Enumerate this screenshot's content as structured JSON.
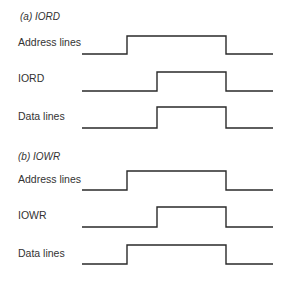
{
  "diagram": {
    "type": "timing-diagram",
    "colors": {
      "line": "#2a2a2a",
      "text": "#333333",
      "background": "#ffffff"
    },
    "sections": [
      {
        "title": "(a) IORD",
        "title_y": 20,
        "signals": [
          {
            "label": "Address lines",
            "label_y": 46,
            "high_y": 36,
            "low_y": 54,
            "x_start": 82,
            "x_rise": 127,
            "x_fall": 226,
            "x_end": 273
          },
          {
            "label": "IORD",
            "label_y": 82,
            "high_y": 72,
            "low_y": 91,
            "x_start": 82,
            "x_rise": 157,
            "x_fall": 226,
            "x_end": 273
          },
          {
            "label": "Data lines",
            "label_y": 120,
            "high_y": 107,
            "low_y": 128,
            "x_start": 82,
            "x_rise": 157,
            "x_fall": 226,
            "x_end": 273
          }
        ]
      },
      {
        "title": "(b) IOWR",
        "title_y": 160,
        "signals": [
          {
            "label": "Address lines",
            "label_y": 183,
            "high_y": 171,
            "low_y": 190,
            "x_start": 82,
            "x_rise": 127,
            "x_fall": 226,
            "x_end": 273
          },
          {
            "label": "IOWR",
            "label_y": 219,
            "high_y": 207,
            "low_y": 227,
            "x_start": 82,
            "x_rise": 157,
            "x_fall": 226,
            "x_end": 273
          },
          {
            "label": "Data lines",
            "label_y": 257,
            "high_y": 245,
            "low_y": 264,
            "x_start": 82,
            "x_rise": 127,
            "x_fall": 226,
            "x_end": 273
          }
        ]
      }
    ]
  }
}
